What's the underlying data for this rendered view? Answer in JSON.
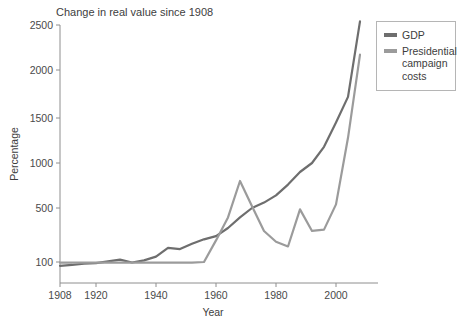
{
  "chart_data": {
    "type": "line",
    "title": "Change in real value since 1908",
    "xlabel": "Year",
    "ylabel": "Percentage",
    "grid": false,
    "legend_position": "right-outside",
    "xlim": [
      1908,
      2010
    ],
    "ylim": [
      60,
      2600
    ],
    "xticks": [
      1908,
      1920,
      1940,
      1960,
      1980,
      2000
    ],
    "xticklabels": [
      "1908",
      "1920",
      "1940",
      "1960",
      "1980",
      "2000"
    ],
    "yticks": [
      100,
      500,
      1000,
      1500,
      2000,
      2500
    ],
    "yticklabels": [
      "100",
      "500",
      "1000",
      "1500",
      "2000",
      "2500"
    ],
    "series": [
      {
        "name": "GDP",
        "color": "#6e6e6e",
        "x": [
          1908,
          1912,
          1916,
          1920,
          1924,
          1928,
          1932,
          1936,
          1940,
          1944,
          1948,
          1952,
          1956,
          1960,
          1964,
          1968,
          1972,
          1976,
          1980,
          1984,
          1988,
          1992,
          1996,
          2000,
          2004,
          2008
        ],
        "y": [
          72,
          78,
          88,
          92,
          104,
          118,
          96,
          112,
          140,
          205,
          196,
          235,
          268,
          292,
          352,
          430,
          500,
          560,
          640,
          760,
          900,
          1000,
          1180,
          1450,
          1720,
          2540
        ]
      },
      {
        "name": "Presidential campaign costs",
        "color": "#9b9b9b",
        "x": [
          1908,
          1912,
          1916,
          1920,
          1924,
          1928,
          1932,
          1936,
          1940,
          1944,
          1948,
          1952,
          1956,
          1960,
          1964,
          1968,
          1972,
          1976,
          1980,
          1984,
          1988,
          1992,
          1996,
          2000,
          2004,
          2008
        ],
        "y": [
          95,
          95,
          95,
          95,
          95,
          95,
          95,
          95,
          95,
          95,
          95,
          95,
          100,
          260,
          430,
          800,
          520,
          330,
          250,
          215,
          490,
          330,
          340,
          540,
          1280,
          2170
        ]
      }
    ]
  },
  "legend": {
    "items": [
      {
        "label": "GDP",
        "color": "#6e6e6e"
      },
      {
        "label": "Presidential campaign costs",
        "color": "#9b9b9b"
      }
    ]
  }
}
